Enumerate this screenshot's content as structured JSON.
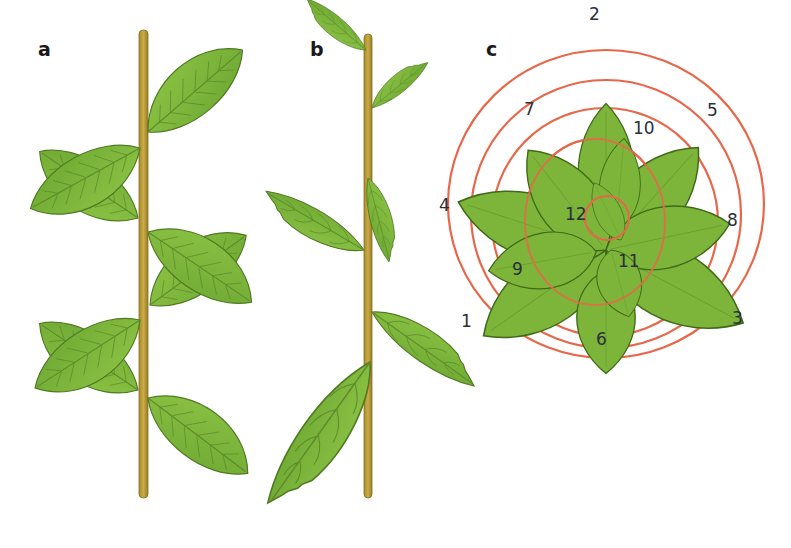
{
  "figure": {
    "panels": [
      {
        "id": "a",
        "label": "a",
        "description": "Opposite decussate leaf arrangement on stem"
      },
      {
        "id": "b",
        "label": "b",
        "description": "Alternate leaf arrangement on stem"
      },
      {
        "id": "c",
        "label": "c",
        "description": "Spiral phyllotaxis viewed from above (rosette)"
      }
    ],
    "rosette_numbers": [
      "1",
      "2",
      "3",
      "4",
      "5",
      "6",
      "7",
      "8",
      "9",
      "10",
      "11",
      "12"
    ],
    "colors": {
      "leaf_fill": "#7fb83a",
      "leaf_dark": "#4f7a22",
      "leaf_vein": "#5e8a2c",
      "stem": "#b89a3a",
      "stem_dark": "#8a7020",
      "spiral": "#e8674a",
      "label_text": "#1a1a1a"
    }
  }
}
